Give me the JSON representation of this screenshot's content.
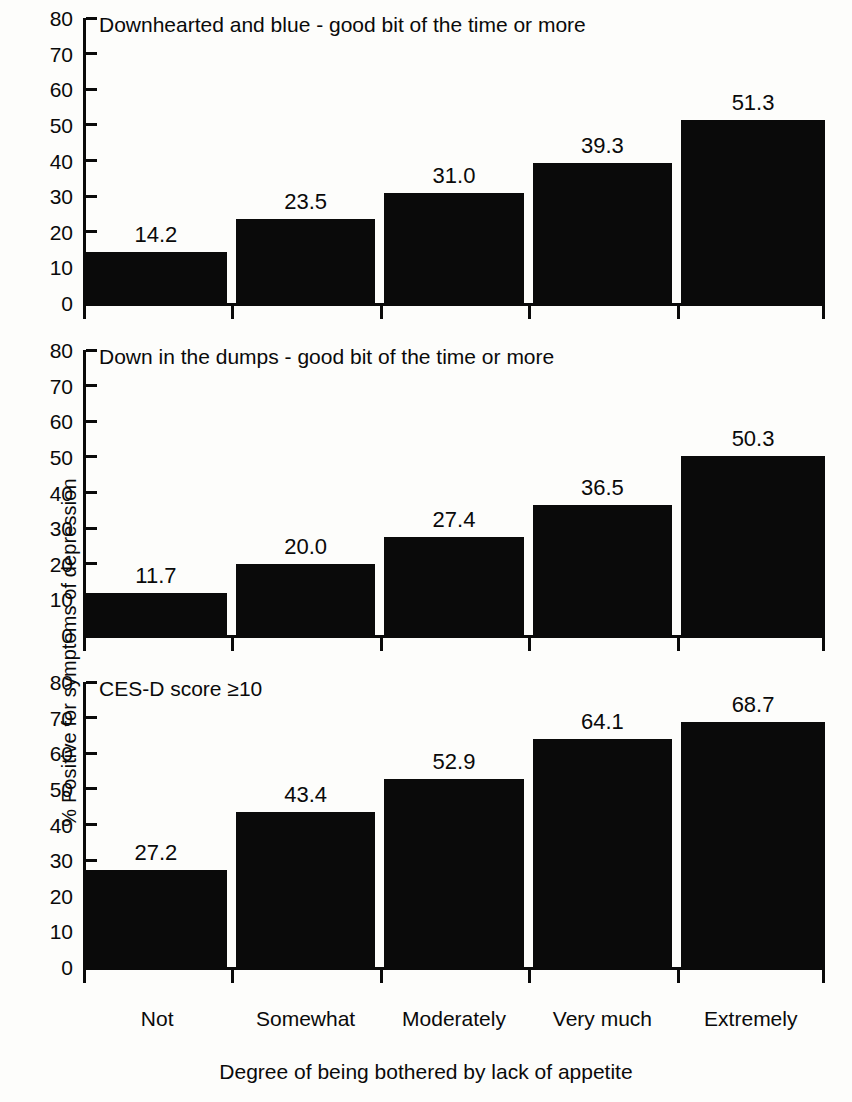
{
  "chart_data": {
    "type": "bar",
    "title": "",
    "xlabel": "Degree of being bothered by lack of appetite",
    "ylabel": "% Positive for symptoms of depression",
    "categories": [
      "Not",
      "Somewhat",
      "Moderately",
      "Very much",
      "Extremely"
    ],
    "ylim": [
      0,
      80
    ],
    "yticks": [
      0,
      10,
      20,
      30,
      40,
      50,
      60,
      70,
      80
    ],
    "grid": false,
    "legend": "none",
    "bar_color": "#0a0a0a",
    "panels": [
      {
        "title": "Downhearted and blue - good bit of the time or more",
        "values": [
          14.2,
          23.5,
          31.0,
          39.3,
          51.3
        ],
        "labels": [
          "14.2",
          "23.5",
          "31.0",
          "39.3",
          "51.3"
        ]
      },
      {
        "title": "Down in the dumps - good bit of the time or more",
        "values": [
          11.7,
          20.0,
          27.4,
          36.5,
          50.3
        ],
        "labels": [
          "11.7",
          "20.0",
          "27.4",
          "36.5",
          "50.3"
        ]
      },
      {
        "title": "CES-D score ≥10",
        "values": [
          27.2,
          43.4,
          52.9,
          64.1,
          68.7
        ],
        "labels": [
          "27.2",
          "43.4",
          "52.9",
          "64.1",
          "68.7"
        ]
      }
    ],
    "series": [
      {
        "name": "Downhearted and blue - good bit of the time or more",
        "values": [
          14.2,
          23.5,
          31.0,
          39.3,
          51.3
        ]
      },
      {
        "name": "Down in the dumps - good bit of the time or more",
        "values": [
          11.7,
          20.0,
          27.4,
          36.5,
          50.3
        ]
      },
      {
        "name": "CES-D score ≥10",
        "values": [
          27.2,
          43.4,
          52.9,
          64.1,
          68.7
        ]
      }
    ]
  }
}
